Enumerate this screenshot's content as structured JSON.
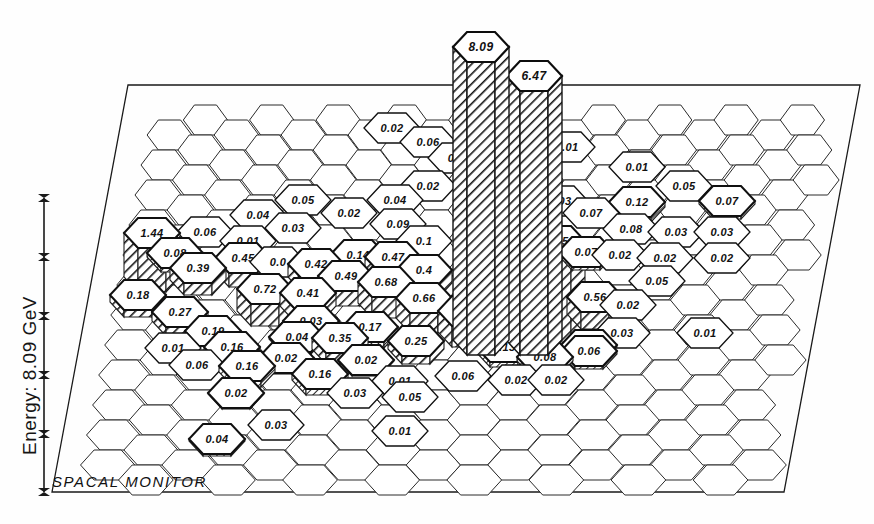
{
  "window": {
    "title": "SPACAL MONITOR",
    "background": "#fefefe",
    "ink": "#1a1a1a"
  },
  "axis": {
    "label": "Energy: 8.09 GeV",
    "tick_glyph": "tick-star",
    "tick_count": 6,
    "orientation": "vertical-left"
  },
  "footer": {
    "label": "SPACAL MONITOR"
  },
  "chart_data": {
    "type": "bar",
    "title": "SPACAL MONITOR",
    "subtitle": "Energy: 8.09 GeV",
    "xlabel": "",
    "ylabel": "Energy: 8.09 GeV",
    "projection": "3d-perspective-hexagonal-lego",
    "grid": false,
    "legend": false,
    "units": "GeV",
    "total_energy": 8.09,
    "max_value": 8.09,
    "ylim": [
      0,
      8.09
    ],
    "cell_shape": "hexagon",
    "categories": [
      "1.44",
      "0.06",
      "0.04",
      "0.03",
      "0.08",
      "0.01",
      "0.39",
      "0.45",
      "0.18",
      "0.72",
      "0.27",
      "0.19",
      "0.16",
      "0.01",
      "0.06",
      "0.16",
      "0.02",
      "0.05",
      "0.02",
      "0.04",
      "0.09",
      "0.42",
      "0.49",
      "0.47",
      "0.41",
      "0.68",
      "0.66",
      "0.69",
      "0.17",
      "0.25",
      "0.35",
      "0.02",
      "0.03",
      "0.14",
      "0.02",
      "0.06",
      "0.0",
      "8.09",
      "6.47",
      "2.95",
      "0.01",
      "0.01",
      "0.05",
      "0.12",
      "0.07",
      "0.07",
      "0.08",
      "0.03",
      "0.03",
      "0.02",
      "0.02",
      "0.05",
      "0.56",
      "0.02",
      "0.4",
      "0.13",
      "0.08",
      "0.06",
      "0.05",
      "0.01",
      "0.03",
      "0.01",
      "0.04",
      "0.03",
      "0.01",
      "0.01",
      "0.02",
      "0.02"
    ],
    "values": [
      1.44,
      0.06,
      0.04,
      0.03,
      0.08,
      0.01,
      0.39,
      0.45,
      0.18,
      0.72,
      0.27,
      0.19,
      0.16,
      0.01,
      0.06,
      0.16,
      0.02,
      0.05,
      0.02,
      0.04,
      0.09,
      0.42,
      0.49,
      0.47,
      0.41,
      0.68,
      0.66,
      0.69,
      0.17,
      0.25,
      0.35,
      0.02,
      0.03,
      0.14,
      0.02,
      0.06,
      0.0,
      8.09,
      6.47,
      2.95,
      0.01,
      0.01,
      0.05,
      0.12,
      0.07,
      0.07,
      0.08,
      0.03,
      0.03,
      0.02,
      0.02,
      0.05,
      0.56,
      0.02,
      0.4,
      0.13,
      0.08,
      0.06,
      0.05,
      0.01,
      0.03,
      0.01,
      0.04,
      0.03,
      0.01,
      0.01,
      0.02,
      0.02
    ]
  },
  "cells": [
    {
      "id": "c-144",
      "label": "1.44",
      "value": 1.44,
      "cx": 152,
      "cy": 233,
      "h": 44,
      "raised": true
    },
    {
      "id": "c-006a",
      "label": "0.06",
      "value": 0.06,
      "cx": 205,
      "cy": 232,
      "h": 3,
      "raised": false
    },
    {
      "id": "c-004a",
      "label": "0.04",
      "value": 0.04,
      "cx": 258,
      "cy": 215,
      "h": 2,
      "raised": false
    },
    {
      "id": "c-005a",
      "label": "0.05",
      "value": 0.05,
      "cx": 303,
      "cy": 200,
      "h": 2,
      "raised": false
    },
    {
      "id": "c-002a",
      "label": "0.02",
      "value": 0.02,
      "cx": 349,
      "cy": 213,
      "h": 1,
      "raised": false
    },
    {
      "id": "c-004b",
      "label": "0.04",
      "value": 0.04,
      "cx": 395,
      "cy": 200,
      "h": 2,
      "raised": false
    },
    {
      "id": "c-002b",
      "label": "0.02",
      "value": 0.02,
      "cx": 428,
      "cy": 186,
      "h": 1,
      "raised": false
    },
    {
      "id": "c-002c",
      "label": "0.02",
      "value": 0.02,
      "cx": 392,
      "cy": 128,
      "h": 1,
      "raised": false
    },
    {
      "id": "c-006b",
      "label": "0.06",
      "value": 0.06,
      "cx": 428,
      "cy": 142,
      "h": 3,
      "raised": false
    },
    {
      "id": "c-00trunc",
      "label": "0.0",
      "value": 0.0,
      "cx": 456,
      "cy": 158,
      "h": 0,
      "raised": false
    },
    {
      "id": "c-008a",
      "label": "0.08",
      "value": 0.08,
      "cx": 175,
      "cy": 253,
      "h": 4,
      "raised": true
    },
    {
      "id": "c-001a",
      "label": "0.01",
      "value": 0.01,
      "cx": 248,
      "cy": 241,
      "h": 1,
      "raised": false
    },
    {
      "id": "c-003a",
      "label": "0.03",
      "value": 0.03,
      "cx": 293,
      "cy": 228,
      "h": 1,
      "raised": false
    },
    {
      "id": "c-009a",
      "label": "0.09",
      "value": 0.09,
      "cx": 398,
      "cy": 224,
      "h": 4,
      "raised": false
    },
    {
      "id": "c-039",
      "label": "0.39",
      "value": 0.39,
      "cx": 198,
      "cy": 268,
      "h": 12,
      "raised": true
    },
    {
      "id": "c-045",
      "label": "0.45",
      "value": 0.45,
      "cx": 243,
      "cy": 258,
      "h": 14,
      "raised": true
    },
    {
      "id": "c-000a",
      "label": "0.0",
      "value": 0.0,
      "cx": 278,
      "cy": 262,
      "h": 0,
      "raised": false
    },
    {
      "id": "c-042",
      "label": "0.42",
      "value": 0.42,
      "cx": 316,
      "cy": 264,
      "h": 13,
      "raised": true
    },
    {
      "id": "c-014",
      "label": "0.14",
      "value": 0.14,
      "cx": 358,
      "cy": 255,
      "h": 6,
      "raised": true
    },
    {
      "id": "c-047",
      "label": "0.47",
      "value": 0.47,
      "cx": 393,
      "cy": 257,
      "h": 15,
      "raised": true
    },
    {
      "id": "c-01b",
      "label": "0.1",
      "value": 0.1,
      "cx": 424,
      "cy": 241,
      "h": 5,
      "raised": false
    },
    {
      "id": "c-018",
      "label": "0.18",
      "value": 0.18,
      "cx": 138,
      "cy": 295,
      "h": 7,
      "raised": true
    },
    {
      "id": "c-072",
      "label": "0.72",
      "value": 0.72,
      "cx": 265,
      "cy": 289,
      "h": 22,
      "raised": true
    },
    {
      "id": "c-041",
      "label": "0.41",
      "value": 0.41,
      "cx": 308,
      "cy": 293,
      "h": 13,
      "raised": true
    },
    {
      "id": "c-049",
      "label": "0.49",
      "value": 0.49,
      "cx": 346,
      "cy": 276,
      "h": 15,
      "raised": true
    },
    {
      "id": "c-068",
      "label": "0.68",
      "value": 0.68,
      "cx": 386,
      "cy": 282,
      "h": 21,
      "raised": true
    },
    {
      "id": "c-04a",
      "label": "0.4",
      "value": 0.4,
      "cx": 424,
      "cy": 270,
      "h": 13,
      "raised": true
    },
    {
      "id": "c-027",
      "label": "0.27",
      "value": 0.27,
      "cx": 180,
      "cy": 312,
      "h": 9,
      "raised": true
    },
    {
      "id": "c-066",
      "label": "0.66",
      "value": 0.66,
      "cx": 424,
      "cy": 298,
      "h": 20,
      "raised": true
    },
    {
      "id": "c-069",
      "label": "0.69",
      "value": 0.69,
      "cx": 466,
      "cy": 311,
      "h": 21,
      "raised": true
    },
    {
      "id": "c-019",
      "label": "0.19",
      "value": 0.19,
      "cx": 213,
      "cy": 331,
      "h": 7,
      "raised": true
    },
    {
      "id": "c-003b",
      "label": "0.03",
      "value": 0.03,
      "cx": 311,
      "cy": 321,
      "h": 1,
      "raised": true
    },
    {
      "id": "c-017",
      "label": "0.17",
      "value": 0.17,
      "cx": 370,
      "cy": 327,
      "h": 6,
      "raised": true
    },
    {
      "id": "c-035",
      "label": "0.35",
      "value": 0.35,
      "cx": 340,
      "cy": 338,
      "h": 11,
      "raised": true
    },
    {
      "id": "c-004c",
      "label": "0.04",
      "value": 0.04,
      "cx": 297,
      "cy": 337,
      "h": 2,
      "raised": true
    },
    {
      "id": "c-025",
      "label": "0.25",
      "value": 0.25,
      "cx": 416,
      "cy": 341,
      "h": 8,
      "raised": true
    },
    {
      "id": "c-001b",
      "label": "0.01",
      "value": 0.01,
      "cx": 173,
      "cy": 348,
      "h": 1,
      "raised": false
    },
    {
      "id": "c-016a",
      "label": "0.16",
      "value": 0.16,
      "cx": 232,
      "cy": 347,
      "h": 6,
      "raised": true
    },
    {
      "id": "c-002d",
      "label": "0.02",
      "value": 0.02,
      "cx": 286,
      "cy": 358,
      "h": 1,
      "raised": true
    },
    {
      "id": "c-002e",
      "label": "0.02",
      "value": 0.02,
      "cx": 366,
      "cy": 360,
      "h": 1,
      "raised": true
    },
    {
      "id": "c-006c",
      "label": "0.06",
      "value": 0.06,
      "cx": 197,
      "cy": 365,
      "h": 3,
      "raised": false
    },
    {
      "id": "c-016b",
      "label": "0.16",
      "value": 0.16,
      "cx": 247,
      "cy": 366,
      "h": 6,
      "raised": true
    },
    {
      "id": "c-016c",
      "label": "0.16",
      "value": 0.16,
      "cx": 320,
      "cy": 374,
      "h": 6,
      "raised": true
    },
    {
      "id": "c-002f",
      "label": "0.02",
      "value": 0.02,
      "cx": 236,
      "cy": 393,
      "h": 1,
      "raised": true
    },
    {
      "id": "c-003c",
      "label": "0.03",
      "value": 0.03,
      "cx": 355,
      "cy": 393,
      "h": 1,
      "raised": false
    },
    {
      "id": "c-001c",
      "label": "0.01",
      "value": 0.01,
      "cx": 400,
      "cy": 381,
      "h": 1,
      "raised": false
    },
    {
      "id": "c-005b",
      "label": "0.05",
      "value": 0.05,
      "cx": 410,
      "cy": 397,
      "h": 2,
      "raised": false
    },
    {
      "id": "c-003d",
      "label": "0.03",
      "value": 0.03,
      "cx": 276,
      "cy": 425,
      "h": 1,
      "raised": false
    },
    {
      "id": "c-004d",
      "label": "0.04",
      "value": 0.04,
      "cx": 217,
      "cy": 439,
      "h": 2,
      "raised": true
    },
    {
      "id": "c-001d",
      "label": "0.01",
      "value": 0.01,
      "cx": 400,
      "cy": 431,
      "h": 1,
      "raised": false
    },
    {
      "id": "c-013",
      "label": "0.13",
      "value": 0.13,
      "cx": 504,
      "cy": 347,
      "h": 5,
      "raised": true
    },
    {
      "id": "c-008b",
      "label": "0.08",
      "value": 0.08,
      "cx": 545,
      "cy": 357,
      "h": 4,
      "raised": true
    },
    {
      "id": "c-006d",
      "label": "0.06",
      "value": 0.06,
      "cx": 463,
      "cy": 376,
      "h": 3,
      "raised": false
    },
    {
      "id": "c-005c",
      "label": "0.05",
      "value": 0.05,
      "cx": 589,
      "cy": 345,
      "h": 2,
      "raised": true
    },
    {
      "id": "c-006e",
      "label": "0.06",
      "value": 0.06,
      "cx": 589,
      "cy": 351,
      "h": 3,
      "raised": true
    },
    {
      "id": "c-002g",
      "label": "0.02",
      "value": 0.02,
      "cx": 516,
      "cy": 380,
      "h": 1,
      "raised": false
    },
    {
      "id": "c-002h",
      "label": "0.02",
      "value": 0.02,
      "cx": 556,
      "cy": 380,
      "h": 1,
      "raised": false
    },
    {
      "id": "c-295",
      "label": "2.95",
      "value": 2.95,
      "cx": 557,
      "cy": 241,
      "h": 86,
      "raised": true
    },
    {
      "id": "c-056",
      "label": "0.56",
      "value": 0.56,
      "cx": 595,
      "cy": 297,
      "h": 17,
      "raised": true
    },
    {
      "id": "c-007a",
      "label": "0.07",
      "value": 0.07,
      "cx": 591,
      "cy": 213,
      "h": 3,
      "raised": false
    },
    {
      "id": "c-007b",
      "label": "0.07",
      "value": 0.07,
      "cx": 586,
      "cy": 252,
      "h": 3,
      "raised": true
    },
    {
      "id": "c-003e",
      "label": "0.03",
      "value": 0.03,
      "cx": 560,
      "cy": 201,
      "h": 1,
      "raised": false
    },
    {
      "id": "c-012",
      "label": "0.12",
      "value": 0.12,
      "cx": 637,
      "cy": 202,
      "h": 5,
      "raised": true
    },
    {
      "id": "c-005d",
      "label": "0.05",
      "value": 0.05,
      "cx": 684,
      "cy": 186,
      "h": 2,
      "raised": false
    },
    {
      "id": "c-007c",
      "label": "0.07",
      "value": 0.07,
      "cx": 727,
      "cy": 201,
      "h": 3,
      "raised": true
    },
    {
      "id": "c-008c",
      "label": "0.08",
      "value": 0.08,
      "cx": 631,
      "cy": 229,
      "h": 4,
      "raised": false
    },
    {
      "id": "c-003f",
      "label": "0.03",
      "value": 0.03,
      "cx": 676,
      "cy": 232,
      "h": 1,
      "raised": false
    },
    {
      "id": "c-003g",
      "label": "0.03",
      "value": 0.03,
      "cx": 722,
      "cy": 232,
      "h": 1,
      "raised": false
    },
    {
      "id": "c-002i",
      "label": "0.02",
      "value": 0.02,
      "cx": 620,
      "cy": 255,
      "h": 1,
      "raised": false
    },
    {
      "id": "c-002j",
      "label": "0.02",
      "value": 0.02,
      "cx": 665,
      "cy": 258,
      "h": 1,
      "raised": false
    },
    {
      "id": "c-002k",
      "label": "0.02",
      "value": 0.02,
      "cx": 722,
      "cy": 258,
      "h": 1,
      "raised": false
    },
    {
      "id": "c-005e",
      "label": "0.05",
      "value": 0.05,
      "cx": 657,
      "cy": 281,
      "h": 2,
      "raised": false
    },
    {
      "id": "c-002l",
      "label": "0.02",
      "value": 0.02,
      "cx": 628,
      "cy": 305,
      "h": 1,
      "raised": false
    },
    {
      "id": "c-003h",
      "label": "0.03",
      "value": 0.03,
      "cx": 622,
      "cy": 333,
      "h": 1,
      "raised": false
    },
    {
      "id": "c-001e",
      "label": "0.01",
      "value": 0.01,
      "cx": 705,
      "cy": 333,
      "h": 1,
      "raised": false
    },
    {
      "id": "c-001f",
      "label": "0.01",
      "value": 0.01,
      "cx": 567,
      "cy": 147,
      "h": 1,
      "raised": false
    },
    {
      "id": "c-001g",
      "label": "0.01",
      "value": 0.01,
      "cx": 637,
      "cy": 167,
      "h": 1,
      "raised": false
    }
  ],
  "bars": [
    {
      "id": "bar-809",
      "label": "8.09",
      "value": 8.09,
      "cx": 481,
      "cy": 47
    },
    {
      "id": "bar-647",
      "label": "6.47",
      "value": 6.47,
      "cx": 534,
      "cy": 76
    }
  ]
}
